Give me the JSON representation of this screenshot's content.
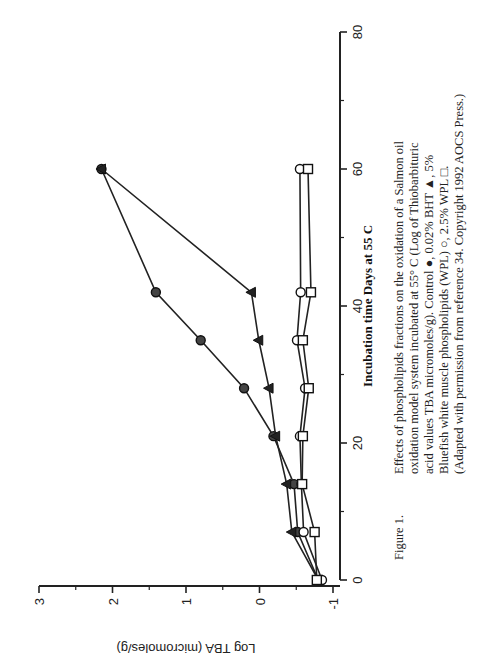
{
  "figure": {
    "label": "Figure 1.",
    "caption_lines": [
      "Effects of phospholipids fractions on the oxidation of a Salmon oil",
      "oxidation model system incubated at 55° C (Log of Thiobarbituric",
      "acid values TBA micromoles/g). Control ●, 0.02% BHT ▲, 5%",
      "Bluefish white muscle phospholipids (WPL) ○, 2.5% WPL □.",
      "(Adapted with permission from reference 34. Copyright 1992 AOCS Press.)"
    ]
  },
  "chart_data": {
    "type": "line",
    "title": "",
    "xlabel": "Incubation time Days at 55 C",
    "ylabel": "Log TBA (micromoles/g)",
    "xlim": [
      0,
      80
    ],
    "ylim": [
      -1,
      3
    ],
    "xticks": [
      0,
      20,
      40,
      60,
      80
    ],
    "yticks": [
      -1,
      0,
      1,
      2,
      3
    ],
    "x_tick_labels": [
      "0",
      "20",
      "40",
      "60",
      "80"
    ],
    "y_tick_labels": [
      "-1",
      "0",
      "1",
      "2",
      "3"
    ],
    "grid": false,
    "legend": "in caption",
    "orientation_note": "figure printed rotated 90 degrees counter-clockwise",
    "series": [
      {
        "name": "Control",
        "marker": "filled-circle",
        "x": [
          0,
          7,
          14,
          21,
          28,
          35,
          42,
          60
        ],
        "y": [
          -0.8,
          -0.52,
          -0.47,
          -0.19,
          0.21,
          0.8,
          1.41,
          2.15
        ]
      },
      {
        "name": "0.02% BHT",
        "marker": "filled-triangle",
        "x": [
          0,
          7,
          14,
          21,
          28,
          35,
          42,
          60
        ],
        "y": [
          -0.8,
          -0.44,
          -0.37,
          -0.22,
          -0.13,
          0.01,
          0.11,
          2.15
        ]
      },
      {
        "name": "5% WPL",
        "marker": "open-circle",
        "x": [
          0,
          7,
          14,
          21,
          28,
          35,
          42,
          60
        ],
        "y": [
          -0.85,
          -0.6,
          -0.57,
          -0.55,
          -0.62,
          -0.51,
          -0.56,
          -0.55
        ]
      },
      {
        "name": "2.5% WPL",
        "marker": "open-square",
        "x": [
          0,
          7,
          14,
          21,
          28,
          35,
          42,
          60
        ],
        "y": [
          -0.78,
          -0.75,
          -0.58,
          -0.59,
          -0.67,
          -0.59,
          -0.7,
          -0.66
        ]
      }
    ]
  }
}
